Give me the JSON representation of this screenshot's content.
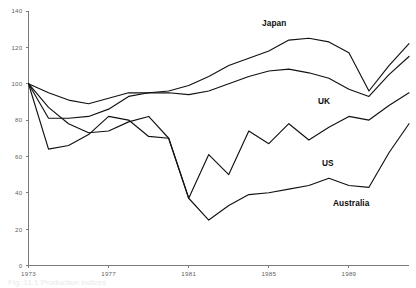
{
  "chart_data": {
    "type": "line",
    "title": "",
    "subtitle": "",
    "xlabel": "",
    "ylabel": "",
    "xlim": [
      1973,
      1992
    ],
    "ylim": [
      0,
      140
    ],
    "grid": false,
    "legend_position": "inline-labels",
    "y_ticks": [
      0,
      20,
      40,
      60,
      80,
      100,
      120,
      140
    ],
    "y_tick_labels": [
      "0",
      "20",
      "40",
      "60",
      "80",
      "100",
      "120",
      "140"
    ],
    "x_ticks": [
      1973,
      1977,
      1981,
      1985,
      1989
    ],
    "x_tick_labels": [
      "1973",
      "1977",
      "1981",
      "1985",
      "1989"
    ],
    "x": [
      1973,
      1974,
      1975,
      1976,
      1977,
      1978,
      1979,
      1980,
      1981,
      1982,
      1983,
      1984,
      1985,
      1986,
      1987,
      1988,
      1989,
      1990,
      1991,
      1992
    ],
    "series": [
      {
        "name": "Japan",
        "label": "Japan",
        "color": "#111111",
        "values": [
          100,
          95,
          91,
          89,
          92,
          95,
          95,
          96,
          99,
          104,
          110,
          114,
          118,
          124,
          125,
          123,
          117,
          96,
          110,
          122
        ]
      },
      {
        "name": "UK",
        "label": "UK",
        "color": "#111111",
        "values": [
          100,
          81,
          81,
          82,
          86,
          93,
          95,
          95,
          94,
          96,
          100,
          104,
          107,
          108,
          106,
          103,
          97,
          93,
          105,
          115
        ]
      },
      {
        "name": "US",
        "label": "US",
        "color": "#111111",
        "values": [
          100,
          87,
          78,
          73,
          74,
          79,
          82,
          70,
          37,
          61,
          50,
          74,
          67,
          78,
          69,
          76,
          82,
          80,
          88,
          95
        ]
      },
      {
        "name": "Australia",
        "label": "Australia",
        "color": "#111111",
        "values": [
          100,
          64,
          66,
          72,
          82,
          80,
          71,
          70,
          37,
          25,
          33,
          39,
          40,
          42,
          44,
          48,
          44,
          43,
          62,
          78
        ]
      }
    ],
    "series_label_positions": [
      {
        "name": "Japan",
        "x_px": 262,
        "y_px": 19
      },
      {
        "name": "UK",
        "x_px": 318,
        "y_px": 97
      },
      {
        "name": "US",
        "x_px": 322,
        "y_px": 159
      },
      {
        "name": "Australia",
        "x_px": 333,
        "y_px": 199
      }
    ]
  },
  "caption": {
    "text": "Fig. 11.1  Production indices"
  }
}
